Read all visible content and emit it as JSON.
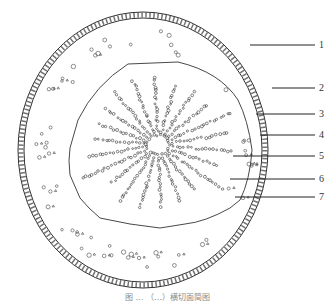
{
  "figure": {
    "type": "cross-section diagram",
    "caption": "图 … （…）横切面简图",
    "labels": [
      {
        "n": "1",
        "y": 45
      },
      {
        "n": "2",
        "y": 88
      },
      {
        "n": "3",
        "y": 114
      },
      {
        "n": "4",
        "y": 135
      },
      {
        "n": "5",
        "y": 156
      },
      {
        "n": "6",
        "y": 179
      },
      {
        "n": "7",
        "y": 197
      }
    ],
    "colors": {
      "line": "#333333",
      "background": "#ffffff"
    }
  }
}
